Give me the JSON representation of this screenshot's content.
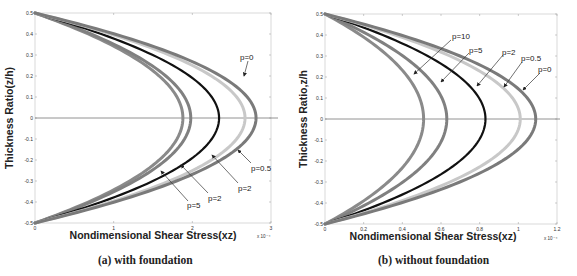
{
  "chart_data": [
    {
      "type": "line",
      "caption": "(a) with foundation",
      "title": "",
      "xlabel": "Nondimensional Shear Stress(xz)",
      "ylabel": "Thickness Ratio(z/h)",
      "x_exponent": "x 10⁻⁴",
      "xlim": [
        0,
        3
      ],
      "ylim": [
        -0.5,
        0.5
      ],
      "xticks": [
        "0",
        "1",
        "2",
        "3"
      ],
      "yticks": [
        "0.5",
        "0.4",
        "0.3",
        "0.2",
        "0.1",
        "0",
        "-0.1",
        "-0.2",
        "-0.3",
        "-0.4",
        "-0.5"
      ],
      "grid": false,
      "profile": "parabolic: tau = tau_max * (1 - 4 z^2)",
      "series": [
        {
          "name": "p=5",
          "peak_at_z0": 1.88,
          "color": "#8a8a8a"
        },
        {
          "name": "p=2",
          "peak_at_z0": 1.98,
          "color": "#808080"
        },
        {
          "name": "p=2",
          "peak_at_z0": 2.34,
          "color": "#111111"
        },
        {
          "name": "p=0.5",
          "peak_at_z0": 2.67,
          "color": "#c8c8c8"
        },
        {
          "name": "p=0",
          "peak_at_z0": 2.81,
          "color": "#7a7a7a"
        }
      ],
      "annotations": [
        "p=0",
        "p=0.5",
        "p=2",
        "p=2",
        "p=5"
      ]
    },
    {
      "type": "line",
      "caption": "(b) without  foundation",
      "title": "",
      "xlabel": "Nondimensional Shear Stress(xz)",
      "ylabel": "Thickness Ratio,z/h",
      "x_exponent": "x 10⁻⁴",
      "xlim": [
        0,
        1.2
      ],
      "ylim": [
        -0.5,
        0.5
      ],
      "xticks": [
        "0",
        "0.2",
        "0.4",
        "0.6",
        "0.8",
        "1",
        "1.2"
      ],
      "yticks": [
        "0.5",
        "0.4",
        "0.3",
        "0.2",
        "0.1",
        "0",
        "-0.1",
        "-0.2",
        "-0.3",
        "-0.4",
        "-0.5"
      ],
      "grid": false,
      "profile": "parabolic: tau = tau_max * (1 - 4 z^2)",
      "series": [
        {
          "name": "p=10",
          "peak_at_z0": 0.51,
          "color": "#8a8a8a"
        },
        {
          "name": "p=5",
          "peak_at_z0": 0.63,
          "color": "#808080"
        },
        {
          "name": "p=2",
          "peak_at_z0": 0.83,
          "color": "#111111"
        },
        {
          "name": "p=0.5",
          "peak_at_z0": 1.01,
          "color": "#c8c8c8"
        },
        {
          "name": "p=0",
          "peak_at_z0": 1.09,
          "color": "#7a7a7a"
        }
      ],
      "annotations": [
        "p=10",
        "p=5",
        "p=2",
        "p=0.5",
        "p=0"
      ]
    }
  ],
  "figure": {
    "caption_a": "(a) with foundation",
    "caption_b": "(b) without  foundation"
  }
}
